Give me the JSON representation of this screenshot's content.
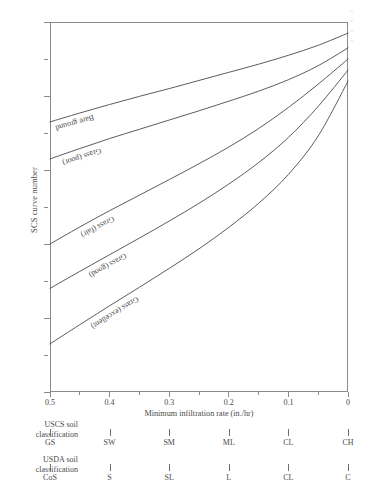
{
  "chart_data": {
    "type": "line",
    "title": "",
    "xlabel": "Minimum infiltration rate (in./hr)",
    "ylabel": "SCS curve number",
    "xlim": [
      0.5,
      0.0
    ],
    "ylim": [
      0,
      100
    ],
    "x_reversed": true,
    "grid": false,
    "legend_position": "inline-along-curves",
    "x_major_ticks": [
      "0.5",
      "0.4",
      "0.3",
      "0.2",
      "0.1",
      "0"
    ],
    "x_major_values": [
      0.5,
      0.4,
      0.3,
      0.2,
      0.1,
      0.0
    ],
    "x_minor_values": [
      0.45,
      0.35,
      0.25,
      0.15,
      0.05
    ],
    "y_major_ticks": [
      "0",
      "20",
      "40",
      "60",
      "80",
      "100"
    ],
    "y_major_values": [
      0,
      20,
      40,
      60,
      80,
      100
    ],
    "y_minor_values": [
      10,
      30,
      50,
      70,
      90
    ],
    "x": [
      0.5,
      0.45,
      0.4,
      0.35,
      0.3,
      0.25,
      0.2,
      0.15,
      0.1,
      0.05,
      0.0
    ],
    "series": [
      {
        "name": "Bare ground",
        "label": "Bare ground",
        "values": [
          73.0,
          75.4,
          77.7,
          79.9,
          82.0,
          84.2,
          86.4,
          88.6,
          91.0,
          93.7,
          97.0
        ]
      },
      {
        "name": "Grass (poor)",
        "label": "Grass (poor)",
        "values": [
          63.0,
          65.8,
          68.5,
          71.0,
          73.5,
          76.0,
          78.6,
          81.3,
          84.4,
          88.2,
          93.0
        ]
      },
      {
        "name": "Grass (fair)",
        "label": "Grass (fair)",
        "values": [
          40.0,
          44.6,
          49.0,
          53.2,
          57.4,
          61.7,
          66.2,
          71.2,
          76.9,
          83.2,
          90.0
        ]
      },
      {
        "name": "Grass (good)",
        "label": "Grass (good)",
        "values": [
          28.0,
          32.6,
          37.1,
          41.6,
          46.2,
          51.0,
          56.2,
          62.0,
          68.8,
          77.2,
          87.0
        ]
      },
      {
        "name": "Grass (excellent)",
        "label": "Grass (excellent)",
        "values": [
          13.0,
          18.2,
          23.3,
          28.3,
          33.4,
          38.7,
          44.5,
          51.0,
          58.8,
          69.2,
          84.0
        ]
      }
    ]
  },
  "axes": {
    "x_title": "Minimum infiltration rate (in./hr)",
    "y_title": "SCS curve number"
  },
  "classification": {
    "uscs": {
      "title_line1": "USCS soil",
      "title_line2": "classification",
      "labels": [
        "GS",
        "SW",
        "SM",
        "ML",
        "CL",
        "CH"
      ],
      "positions": [
        0.5,
        0.4,
        0.3,
        0.2,
        0.1,
        0.0
      ]
    },
    "usda": {
      "title_line1": "USDA soil",
      "title_line2": "classification",
      "labels": [
        "CoS",
        "S",
        "SL",
        "L",
        "CL",
        "C"
      ],
      "positions": [
        0.5,
        0.4,
        0.3,
        0.2,
        0.1,
        0.0
      ]
    }
  },
  "style": {
    "curve_color": "#4a4a4a",
    "axis_color": "#8a8a8a",
    "text_color": "#4a4a4a",
    "background": "#ffffff"
  }
}
